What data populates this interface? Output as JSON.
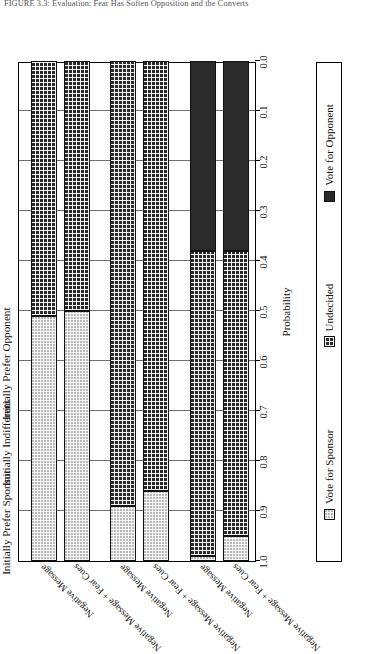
{
  "caption": {
    "text": "FIGURE 3.3: Evaluation: Fear Has Soften Opposition and the Converts"
  },
  "chart_data": {
    "type": "bar",
    "orientation": "horizontal-stacked",
    "title": "",
    "xlabel": "",
    "ylabel": "Probability",
    "ylim": [
      0.0,
      1.0
    ],
    "grid": true,
    "axis_direction": "reversed",
    "tick_labels": [
      "1.0",
      "0.9",
      "0.8",
      "0.7",
      "0.6",
      "0.5",
      "0.4",
      "0.3",
      "0.2",
      "0.1",
      "0.0"
    ],
    "tick_values": [
      1.0,
      0.9,
      0.8,
      0.7,
      0.6,
      0.5,
      0.4,
      0.3,
      0.2,
      0.1,
      0.0
    ],
    "groups": [
      {
        "label": "Initially Prefer Sponsor",
        "categories": [
          "Negative Message",
          "Negative Message + Fear Cues"
        ]
      },
      {
        "label": "Initially Indifferent",
        "categories": [
          "Negative Message",
          "Negative Message + Fear Cues"
        ]
      },
      {
        "label": "Initially Prefer Opponent",
        "categories": [
          "Negative Message",
          "Negative Message + Fear Cues"
        ]
      }
    ],
    "legend": {
      "position": "bottom",
      "entries": [
        {
          "name": "Vote for Sponsor",
          "fill": "light-gray-checker",
          "color": "#b9b9b9"
        },
        {
          "name": "Undecided",
          "fill": "dark-checker",
          "color": "#2b2b2b"
        },
        {
          "name": "Vote for Opponent",
          "fill": "solid-black",
          "color": "#2a2a2a"
        }
      ]
    },
    "categories": [
      "Initially Prefer Sponsor / Negative Message",
      "Initially Prefer Sponsor / Negative Message + Fear Cues",
      "Initially Indifferent / Negative Message",
      "Initially Indifferent / Negative Message + Fear Cues",
      "Initially Prefer Opponent / Negative Message",
      "Initially Prefer Opponent / Negative Message + Fear Cues"
    ],
    "series": [
      {
        "name": "Vote for Sponsor",
        "values": [
          0.49,
          0.5,
          0.11,
          0.14,
          0.01,
          0.05
        ]
      },
      {
        "name": "Undecided",
        "values": [
          0.51,
          0.5,
          0.89,
          0.86,
          0.61,
          0.57
        ]
      },
      {
        "name": "Vote for Opponent",
        "values": [
          0.0,
          0.0,
          0.0,
          0.0,
          0.38,
          0.38
        ]
      }
    ],
    "bars": [
      {
        "group": 0,
        "category": "Negative Message",
        "segments": [
          {
            "series": "Vote for Sponsor",
            "value": 0.49
          },
          {
            "series": "Undecided",
            "value": 0.51
          },
          {
            "series": "Vote for Opponent",
            "value": 0.0
          }
        ]
      },
      {
        "group": 0,
        "category": "Negative Message + Fear Cues",
        "segments": [
          {
            "series": "Vote for Sponsor",
            "value": 0.5
          },
          {
            "series": "Undecided",
            "value": 0.5
          },
          {
            "series": "Vote for Opponent",
            "value": 0.0
          }
        ]
      },
      {
        "group": 1,
        "category": "Negative Message",
        "segments": [
          {
            "series": "Vote for Sponsor",
            "value": 0.11
          },
          {
            "series": "Undecided",
            "value": 0.89
          },
          {
            "series": "Vote for Opponent",
            "value": 0.0
          }
        ]
      },
      {
        "group": 1,
        "category": "Negative Message + Fear Cues",
        "segments": [
          {
            "series": "Vote for Sponsor",
            "value": 0.14
          },
          {
            "series": "Undecided",
            "value": 0.86
          },
          {
            "series": "Vote for Opponent",
            "value": 0.0
          }
        ]
      },
      {
        "group": 2,
        "category": "Negative Message",
        "segments": [
          {
            "series": "Vote for Sponsor",
            "value": 0.01
          },
          {
            "series": "Undecided",
            "value": 0.61
          },
          {
            "series": "Vote for Opponent",
            "value": 0.38
          }
        ]
      },
      {
        "group": 2,
        "category": "Negative Message + Fear Cues",
        "segments": [
          {
            "series": "Vote for Sponsor",
            "value": 0.05
          },
          {
            "series": "Undecided",
            "value": 0.57
          },
          {
            "series": "Vote for Opponent",
            "value": 0.38
          }
        ]
      }
    ]
  }
}
